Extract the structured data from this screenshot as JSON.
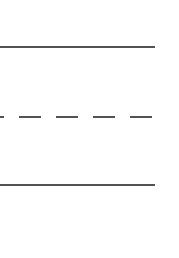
{
  "diagram": {
    "background": "#ffffff",
    "stroke_color": "#1a1a1a",
    "lines": [
      {
        "id": "top-solid-line",
        "style": "solid",
        "y": 47,
        "x1": 0,
        "x2": 155,
        "width": 1.6
      },
      {
        "id": "middle-dashed-line",
        "style": "dashed",
        "y": 117,
        "x1": 0,
        "x2": 155,
        "width": 1.6,
        "dash": "22,15",
        "dash_offset": 18
      },
      {
        "id": "bottom-solid-line",
        "style": "solid",
        "y": 185,
        "x1": 0,
        "x2": 155,
        "width": 1.6
      }
    ]
  }
}
